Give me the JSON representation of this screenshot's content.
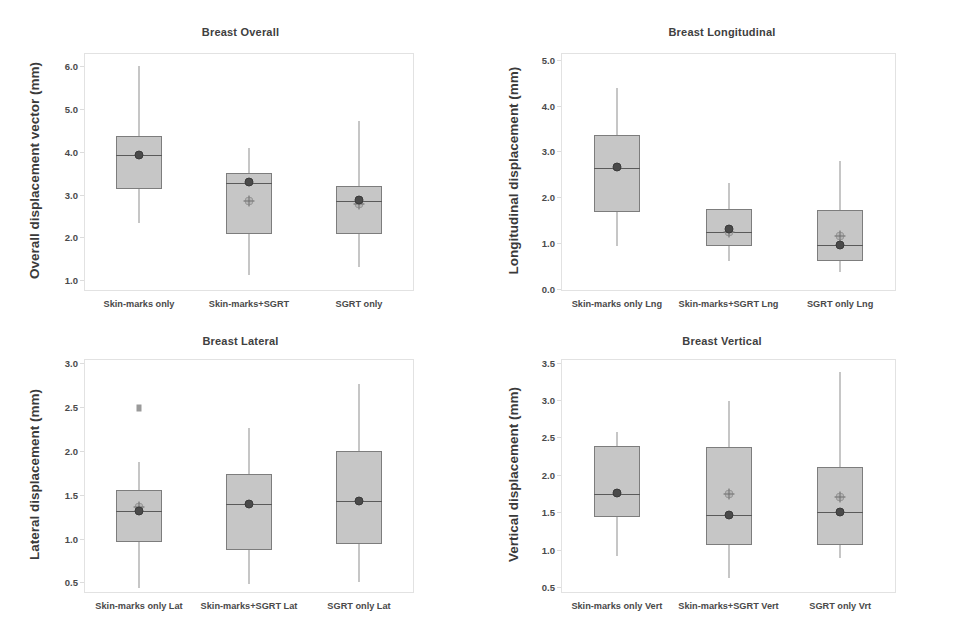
{
  "figure": {
    "background": "#ffffff",
    "box_fill": "#c6c6c6",
    "box_edge": "#7d7d7d",
    "whisker_color": "#8d8d8d",
    "mean_marker_color": "#4a4a4a",
    "crosshair_marker_color": "#b4b4b4"
  },
  "chart_data": [
    {
      "type": "box",
      "panel": "top-left",
      "title": "Breast Overall",
      "xlabel": "",
      "ylabel": "Overall displacement vector (mm)",
      "ylim": [
        0.75,
        6.3
      ],
      "yticks": [
        1.0,
        2.0,
        3.0,
        4.0,
        5.0,
        6.0
      ],
      "ytick_labels": [
        "1.0",
        "2.0",
        "3.0",
        "4.0",
        "5.0",
        "6.0"
      ],
      "grid": false,
      "legend": "none",
      "categories": [
        "Skin-marks only",
        "Skin-marks+SGRT",
        "SGRT only"
      ],
      "boxes": [
        {
          "label": "Skin-marks only",
          "whisker_low": 2.33,
          "q1": 3.12,
          "median": 3.92,
          "q3": 4.37,
          "whisker_high": 6.0,
          "mean": 3.93,
          "mean2": null,
          "outliers": []
        },
        {
          "label": "Skin-marks+SGRT",
          "whisker_low": 1.13,
          "q1": 2.09,
          "median": 3.26,
          "q3": 3.5,
          "whisker_high": 4.08,
          "mean": 3.3,
          "mean2": 2.85,
          "outliers": []
        },
        {
          "label": "SGRT only",
          "whisker_low": 1.32,
          "q1": 2.07,
          "median": 2.86,
          "q3": 3.2,
          "whisker_high": 4.72,
          "mean": 2.88,
          "mean2": 2.78,
          "outliers": []
        }
      ]
    },
    {
      "type": "box",
      "panel": "top-right",
      "title": "Breast Longitudinal",
      "xlabel": "",
      "ylabel": "Longitudinal displacement (mm)",
      "ylim": [
        -0.05,
        5.15
      ],
      "yticks": [
        0.0,
        1.0,
        2.0,
        3.0,
        4.0,
        5.0
      ],
      "ytick_labels": [
        "0.0",
        "1.0",
        "2.0",
        "3.0",
        "4.0",
        "5.0"
      ],
      "grid": false,
      "legend": "none",
      "categories": [
        "Skin-marks only Lng",
        "Skin-marks+SGRT Lng",
        "SGRT only Lng"
      ],
      "boxes": [
        {
          "label": "Skin-marks only Lng",
          "whisker_low": 0.93,
          "q1": 1.67,
          "median": 2.64,
          "q3": 3.36,
          "whisker_high": 4.38,
          "mean": 2.65,
          "mean2": null,
          "outliers": []
        },
        {
          "label": "Skin-marks+SGRT Lng",
          "whisker_low": 0.61,
          "q1": 0.93,
          "median": 1.23,
          "q3": 1.74,
          "whisker_high": 2.3,
          "mean": 1.3,
          "mean2": 1.24,
          "outliers": []
        },
        {
          "label": "SGRT only Lng",
          "whisker_low": 0.37,
          "q1": 0.6,
          "median": 0.95,
          "q3": 1.71,
          "whisker_high": 2.78,
          "mean": 0.95,
          "mean2": 1.15,
          "outliers": []
        }
      ]
    },
    {
      "type": "box",
      "panel": "bottom-left",
      "title": "Breast Lateral",
      "xlabel": "",
      "ylabel": "Lateral displacement (mm)",
      "ylim": [
        0.38,
        3.05
      ],
      "yticks": [
        0.5,
        1.0,
        1.5,
        2.0,
        2.5,
        3.0
      ],
      "ytick_labels": [
        "0.5",
        "1.0",
        "1.5",
        "2.0",
        "2.5",
        "3.0"
      ],
      "grid": false,
      "legend": "none",
      "categories": [
        "Skin-marks only Lat",
        "Skin-marks+SGRT Lat",
        "SGRT only Lat"
      ],
      "boxes": [
        {
          "label": "Skin-marks only Lat",
          "whisker_low": 0.44,
          "q1": 0.96,
          "median": 1.31,
          "q3": 1.56,
          "whisker_high": 1.87,
          "mean": 1.31,
          "mean2": 1.36,
          "outliers": [
            2.49
          ]
        },
        {
          "label": "Skin-marks+SGRT Lat",
          "whisker_low": 0.48,
          "q1": 0.87,
          "median": 1.39,
          "q3": 1.74,
          "whisker_high": 2.26,
          "mean": 1.39,
          "mean2": null,
          "outliers": []
        },
        {
          "label": "SGRT only Lat",
          "whisker_low": 0.51,
          "q1": 0.94,
          "median": 1.43,
          "q3": 2.0,
          "whisker_high": 2.76,
          "mean": 1.43,
          "mean2": null,
          "outliers": []
        }
      ]
    },
    {
      "type": "box",
      "panel": "bottom-right",
      "title": "Breast Vertical",
      "xlabel": "",
      "ylabel": "Vertical displacement (mm)",
      "ylim": [
        0.42,
        3.55
      ],
      "yticks": [
        0.5,
        1.0,
        1.5,
        2.0,
        2.5,
        3.0,
        3.5
      ],
      "ytick_labels": [
        "0.5",
        "1.0",
        "1.5",
        "2.0",
        "2.5",
        "3.0",
        "3.5"
      ],
      "grid": false,
      "legend": "none",
      "categories": [
        "Skin-marks only Vert",
        "Skin-marks+SGRT Vert",
        "SGRT only Vrt"
      ],
      "boxes": [
        {
          "label": "Skin-marks only Vert",
          "whisker_low": 0.92,
          "q1": 1.44,
          "median": 1.75,
          "q3": 2.39,
          "whisker_high": 2.58,
          "mean": 1.76,
          "mean2": null,
          "outliers": []
        },
        {
          "label": "Skin-marks+SGRT Vert",
          "whisker_low": 0.62,
          "q1": 1.06,
          "median": 1.47,
          "q3": 2.37,
          "whisker_high": 2.99,
          "mean": 1.47,
          "mean2": 1.75,
          "outliers": []
        },
        {
          "label": "SGRT only Vrt",
          "whisker_low": 0.89,
          "q1": 1.06,
          "median": 1.51,
          "q3": 2.1,
          "whisker_high": 3.38,
          "mean": 1.51,
          "mean2": 1.7,
          "outliers": []
        }
      ]
    }
  ]
}
